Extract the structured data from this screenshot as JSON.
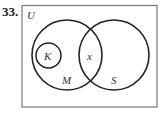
{
  "problem_number": "33.",
  "diagram": {
    "type": "venn",
    "universe_label": "U",
    "sets": [
      {
        "label": "M",
        "contains": [
          "K"
        ]
      },
      {
        "label": "S"
      },
      {
        "label": "K",
        "subset_of": "M"
      }
    ],
    "intersection_label": "x",
    "labels": {
      "U": "U",
      "K": "K",
      "M": "M",
      "S": "S",
      "x": "x"
    }
  }
}
